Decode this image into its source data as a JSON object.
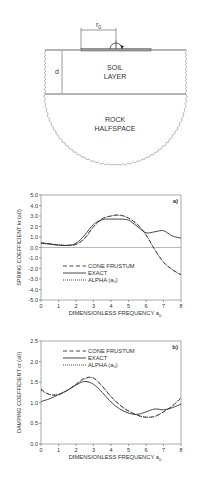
{
  "diagram": {
    "r0_label": "r",
    "r0_sub": "0",
    "d_label": "d",
    "soil_label_1": "SOIL",
    "soil_label_2": "LAYER",
    "rock_label_1": "ROCK",
    "rock_label_2": "HALFSPACE"
  },
  "chart_data": [
    {
      "type": "line",
      "panel": "a)",
      "ylabel": "SPRING COEFFICIENT  k_r (a_0)",
      "xlabel": "DIMENSIONLESS FREQUENCY a_0",
      "xlim": [
        0,
        8
      ],
      "ylim": [
        -5.0,
        5.0
      ],
      "xticks": [
        "0",
        "1",
        "2",
        "3",
        "4",
        "5",
        "6",
        "7",
        "8"
      ],
      "yticks": [
        "5.0",
        "4.0",
        "3.0",
        "2.0",
        "1.0",
        "0.0",
        "-1.0",
        "-2.0",
        "-3.0",
        "-4.0",
        "-5.0"
      ],
      "legend": [
        "CONE FRUSTUM",
        "EXACT",
        "ALPHA (a0)"
      ],
      "x": [
        0,
        0.5,
        1,
        1.5,
        2,
        2.5,
        3,
        3.5,
        4,
        4.5,
        5,
        5.5,
        6,
        6.5,
        7,
        7.5,
        8
      ],
      "series": [
        {
          "name": "CONE FRUSTUM",
          "style": "dashed",
          "values": [
            0.45,
            0.35,
            0.25,
            0.2,
            0.3,
            0.9,
            2.0,
            2.75,
            3.0,
            3.1,
            2.8,
            2.2,
            1.2,
            -0.2,
            -1.4,
            -2.1,
            -2.6
          ]
        },
        {
          "name": "EXACT",
          "style": "solid",
          "values": [
            0.4,
            0.32,
            0.22,
            0.2,
            0.4,
            1.2,
            2.2,
            2.65,
            2.7,
            2.7,
            2.6,
            2.0,
            1.4,
            1.5,
            1.6,
            1.1,
            0.9
          ]
        },
        {
          "name": "ALPHA (a0)",
          "style": "dotted",
          "values": [
            0.45,
            0.35,
            0.25,
            0.2,
            0.3,
            0.85,
            1.95,
            2.7,
            3.0,
            3.05,
            2.8,
            2.2,
            1.2,
            -0.2,
            -1.4,
            -2.1,
            -2.6
          ]
        }
      ]
    },
    {
      "type": "line",
      "panel": "b)",
      "ylabel": "DAMPING COEFFICIENT  c_r (a_0)",
      "xlabel": "DIMENSIONLESS FREQUENCY a_0",
      "xlim": [
        0,
        8
      ],
      "ylim": [
        0.0,
        2.5
      ],
      "xticks": [
        "0",
        "1",
        "2",
        "3",
        "4",
        "5",
        "6",
        "7",
        "8"
      ],
      "yticks": [
        "2.5",
        "2.0",
        "1.5",
        "1.0",
        "0.5",
        "0.0"
      ],
      "legend": [
        "CONE FRUSTUM",
        "EXACT",
        "ALPHA (a0)"
      ],
      "x": [
        0,
        0.5,
        1,
        1.5,
        2,
        2.5,
        3,
        3.5,
        4,
        4.5,
        5,
        5.5,
        6,
        6.5,
        7,
        7.5,
        8
      ],
      "series": [
        {
          "name": "CONE FRUSTUM",
          "style": "dashed",
          "values": [
            1.33,
            1.2,
            1.2,
            1.3,
            1.45,
            1.6,
            1.6,
            1.4,
            1.15,
            0.95,
            0.8,
            0.7,
            0.65,
            0.67,
            0.78,
            0.92,
            1.12
          ]
        },
        {
          "name": "EXACT",
          "style": "solid",
          "values": [
            1.03,
            1.1,
            1.2,
            1.3,
            1.43,
            1.52,
            1.45,
            1.25,
            1.02,
            0.85,
            0.75,
            0.72,
            0.78,
            0.85,
            0.83,
            0.88,
            0.97
          ]
        },
        {
          "name": "ALPHA (a0)",
          "style": "dotted",
          "values": [
            1.3,
            1.2,
            1.2,
            1.3,
            1.45,
            1.58,
            1.6,
            1.4,
            1.15,
            0.95,
            0.8,
            0.7,
            0.65,
            0.67,
            0.78,
            0.92,
            1.12
          ]
        }
      ]
    }
  ]
}
